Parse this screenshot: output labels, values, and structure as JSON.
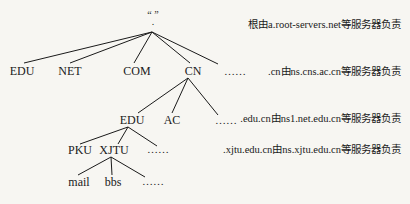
{
  "diagram": {
    "root": {
      "label": "“ ”",
      "dot": "."
    },
    "level1": [
      {
        "label": "EDU"
      },
      {
        "label": "NET"
      },
      {
        "label": "COM"
      },
      {
        "label": "CN"
      },
      {
        "label": "……"
      }
    ],
    "level2": [
      {
        "label": "EDU"
      },
      {
        "label": "AC"
      },
      {
        "label": "……"
      }
    ],
    "level3": [
      {
        "label": "PKU"
      },
      {
        "label": "XJTU"
      },
      {
        "label": "……"
      }
    ],
    "level4": [
      {
        "label": "mail"
      },
      {
        "label": "bbs"
      },
      {
        "label": "……"
      }
    ],
    "notes": [
      "根由a.root-servers.net等服务器负责",
      ".cn由ns.cns.ac.cn等服务器负责",
      ".edu.cn由ns1.net.edu.cn等服务器负责",
      ".xjtu.edu.cn由ns.xjtu.edu.cn等服务器负责"
    ],
    "line_color": "#1a1a1a"
  }
}
